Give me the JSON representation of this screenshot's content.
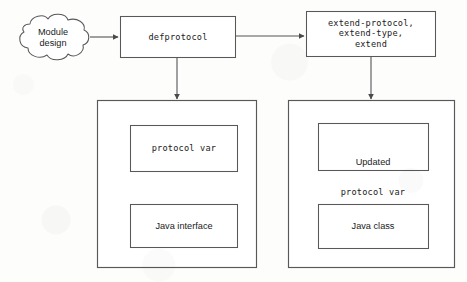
{
  "diagram": {
    "colors": {
      "stroke": "#555555",
      "stroke_light": "#6d6d6d",
      "text": "#1b1b1b",
      "background": "#fdfdfc"
    },
    "nodes": {
      "cloud": {
        "shape": "cloud",
        "label": "Module\ndesign"
      },
      "defprotocol": {
        "shape": "rectangle",
        "label": "defprotocol"
      },
      "extend_forms": {
        "shape": "rectangle",
        "label": "extend-protocol,\nextend-type,\nextend"
      },
      "left_container": {
        "shape": "rectangle",
        "label": ""
      },
      "right_container": {
        "shape": "rectangle",
        "label": ""
      },
      "protocol_var": {
        "shape": "rectangle",
        "label": "protocol var"
      },
      "java_interface": {
        "shape": "rectangle",
        "label": "Java interface"
      },
      "updated_protocol_var": {
        "shape": "rectangle",
        "label_line1": "Updated",
        "label_line2": "protocol var"
      },
      "java_class": {
        "shape": "rectangle",
        "label": "Java class"
      }
    },
    "edges": [
      {
        "id": "cloud-to-defprotocol",
        "from": "cloud",
        "to": "defprotocol",
        "direction": "right",
        "arrowhead": true
      },
      {
        "id": "defprotocol-to-extend",
        "from": "defprotocol",
        "to": "extend_forms",
        "direction": "right",
        "arrowhead": true
      },
      {
        "id": "defprotocol-to-left-container",
        "from": "defprotocol",
        "to": "left_container",
        "direction": "down",
        "arrowhead": true
      },
      {
        "id": "extend-to-right-container",
        "from": "extend_forms",
        "to": "right_container",
        "direction": "down",
        "arrowhead": true
      }
    ]
  }
}
